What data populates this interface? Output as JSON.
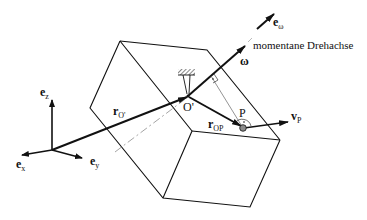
{
  "diagram": {
    "axis_label": "momentane Drehachse",
    "labels": {
      "ez": {
        "main": "e",
        "sub": "z"
      },
      "ex": {
        "main": "e",
        "sub": "x"
      },
      "ey": {
        "main": "e",
        "sub": "y"
      },
      "rO": {
        "main": "r",
        "sub": "O'"
      },
      "Oprime": "O'",
      "omega": "ω",
      "eomega": {
        "main": "e",
        "sub": "ω"
      },
      "rOP": {
        "main": "r",
        "sub": "OP"
      },
      "P": "P",
      "vP": {
        "main": "v",
        "sub": "P"
      }
    },
    "colors": {
      "line": "#111111",
      "dashdot": "#9a9a9a",
      "point_fill": "#8a8a8a"
    }
  }
}
